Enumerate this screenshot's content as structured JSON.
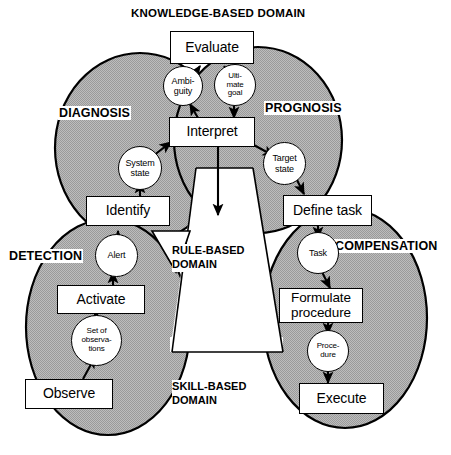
{
  "diagram": {
    "title": "KNOWLEDGE-BASED DOMAIN",
    "colors": {
      "ellipse_fill": "#b3b3b3",
      "ellipse_stroke": "#000000",
      "node_fill": "#ffffff",
      "node_stroke": "#000000",
      "text": "#000000",
      "background": "#ffffff"
    },
    "domains": [
      {
        "id": "knowledge",
        "label": "KNOWLEDGE-BASED DOMAIN"
      },
      {
        "id": "rule",
        "label_line1": "RULE-BASED",
        "label_line2": "DOMAIN"
      },
      {
        "id": "skill",
        "label_line1": "SKILL-BASED",
        "label_line2": "DOMAIN"
      }
    ],
    "regions": [
      {
        "id": "diagnosis",
        "label": "DIAGNOSIS"
      },
      {
        "id": "prognosis",
        "label": "PROGNOSIS"
      },
      {
        "id": "detection",
        "label": "DETECTION"
      },
      {
        "id": "compensation",
        "label": "COMPENSATION"
      }
    ],
    "activities": [
      {
        "id": "evaluate",
        "label": "Evaluate"
      },
      {
        "id": "interpret",
        "label": "Interpret"
      },
      {
        "id": "identify",
        "label": "Identify"
      },
      {
        "id": "define-task",
        "label": "Define task"
      },
      {
        "id": "activate",
        "label": "Activate"
      },
      {
        "id": "formulate-procedure",
        "line1": "Formulate",
        "line2": "procedure"
      },
      {
        "id": "observe",
        "label": "Observe"
      },
      {
        "id": "execute",
        "label": "Execute"
      }
    ],
    "states": [
      {
        "id": "ambiguity",
        "line1": "Ambi-",
        "line2": "guity"
      },
      {
        "id": "ultimate-goal",
        "line1": "Ulti-",
        "line2": "mate",
        "line3": "goal"
      },
      {
        "id": "system-state",
        "line1": "System",
        "line2": "state"
      },
      {
        "id": "target-state",
        "line1": "Target",
        "line2": "state"
      },
      {
        "id": "alert",
        "line1": "Alert"
      },
      {
        "id": "task",
        "line1": "Task"
      },
      {
        "id": "set-of-observations",
        "line1": "Set of",
        "line2": "observa-",
        "line3": "tions"
      },
      {
        "id": "procedure",
        "line1": "Proce-",
        "line2": "dure"
      }
    ]
  }
}
